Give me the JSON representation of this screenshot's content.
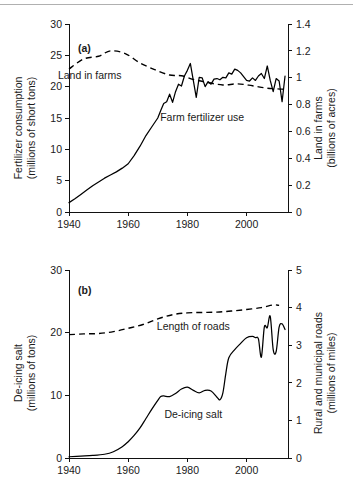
{
  "figure": {
    "background": "#ffffff",
    "line_color": "#000000",
    "axis_color": "#111111",
    "rule_color": "#b0b0b0"
  },
  "chart_data": [
    {
      "type": "line",
      "panel_tag": "(a)",
      "title": "",
      "xlabel": "",
      "ylabel": "Fertilizer consumption\n(millions of short tons)",
      "ylabel_line1": "Fertilizer consumption",
      "ylabel_line2": "(millions of short tons)",
      "y2label_line1": "Land in farms",
      "y2label_line2": "(billions of acres)",
      "xlim": [
        1940,
        2014
      ],
      "ylim": [
        0,
        30
      ],
      "y2lim": [
        0,
        1.4
      ],
      "grid": false,
      "legend_position": "inline-annotation",
      "xticks": [
        1940,
        1960,
        1980,
        2000
      ],
      "xtick_labels": [
        "1940",
        "1960",
        "1980",
        "2000"
      ],
      "yticks": [
        0,
        5,
        10,
        15,
        20,
        25,
        30
      ],
      "ytick_labels": [
        "0",
        "5",
        "10",
        "15",
        "20",
        "25",
        "30"
      ],
      "y2ticks": [
        0,
        0.2,
        0.4,
        0.6,
        0.8,
        1.0,
        1.2,
        1.4
      ],
      "y2tick_labels": [
        "0",
        "0.2",
        "0.4",
        "0.6",
        "0.8",
        "1",
        "1.2",
        "1.4"
      ],
      "series": [
        {
          "name": "Farm fertilizer use",
          "style": "solid",
          "axis": "left",
          "units": "millions of short tons",
          "x": [
            1940,
            1942,
            1944,
            1946,
            1948,
            1950,
            1952,
            1954,
            1956,
            1958,
            1960,
            1962,
            1964,
            1966,
            1968,
            1970,
            1971,
            1972,
            1973,
            1974,
            1975,
            1976,
            1977,
            1978,
            1979,
            1980,
            1981,
            1982,
            1983,
            1984,
            1985,
            1986,
            1987,
            1988,
            1989,
            1990,
            1991,
            1992,
            1993,
            1994,
            1995,
            1996,
            1997,
            1998,
            1999,
            2000,
            2001,
            2002,
            2003,
            2004,
            2005,
            2006,
            2007,
            2008,
            2009,
            2010,
            2011,
            2012,
            2013
          ],
          "y": [
            1.5,
            2.1,
            2.8,
            3.5,
            4.2,
            4.8,
            5.4,
            5.9,
            6.4,
            7.0,
            7.7,
            9.0,
            10.5,
            12.2,
            13.6,
            15.0,
            16.2,
            17.3,
            17.6,
            18.8,
            17.5,
            19.2,
            20.4,
            20.1,
            21.7,
            22.6,
            23.7,
            21.0,
            18.3,
            21.5,
            21.4,
            20.0,
            20.8,
            20.4,
            21.2,
            21.3,
            21.1,
            21.5,
            21.4,
            22.2,
            22.0,
            22.8,
            22.6,
            22.2,
            21.6,
            21.0,
            20.9,
            21.4,
            21.0,
            21.7,
            22.1,
            21.3,
            23.3,
            21.0,
            19.2,
            21.3,
            20.9,
            17.6,
            21.7
          ]
        },
        {
          "name": "Land in farms",
          "style": "dashed",
          "axis": "right",
          "units": "billions of acres",
          "x": [
            1940,
            1945,
            1950,
            1954,
            1959,
            1964,
            1969,
            1974,
            1978,
            1982,
            1987,
            1992,
            1997,
            2002,
            2007,
            2012,
            2013
          ],
          "y": [
            1.065,
            1.14,
            1.16,
            1.2,
            1.18,
            1.11,
            1.06,
            1.02,
            1.015,
            0.987,
            0.964,
            0.946,
            0.954,
            0.94,
            0.922,
            0.915,
            0.91
          ]
        }
      ],
      "annotations": [
        {
          "text": "Land in farms",
          "x_year": 1947,
          "y_value": 21.3
        },
        {
          "text": "Farm fertilizer use",
          "x_year": 1985,
          "y_value": 14.6
        }
      ]
    },
    {
      "type": "line",
      "panel_tag": "(b)",
      "title": "",
      "xlabel": "",
      "ylabel_line1": "De-icing salt",
      "ylabel_line2": "(millions of tons)",
      "y2label_line1": "Rural and municipal roads",
      "y2label_line2": "(millions of miles)",
      "xlim": [
        1940,
        2014
      ],
      "ylim": [
        0,
        30
      ],
      "y2lim": [
        0,
        5
      ],
      "grid": false,
      "legend_position": "inline-annotation",
      "xticks": [
        1940,
        1960,
        1980,
        2000
      ],
      "xtick_labels": [
        "1940",
        "1960",
        "1980",
        "2000"
      ],
      "yticks": [
        0,
        10,
        20,
        30
      ],
      "ytick_labels": [
        "0",
        "10",
        "20",
        "30"
      ],
      "y2ticks": [
        0,
        1,
        2,
        3,
        4,
        5
      ],
      "y2tick_labels": [
        "0",
        "1",
        "2",
        "3",
        "4",
        "5"
      ],
      "series": [
        {
          "name": "De-icing salt",
          "style": "solid",
          "axis": "left",
          "units": "millions of tons",
          "x": [
            1940,
            1944,
            1948,
            1952,
            1955,
            1958,
            1960,
            1962,
            1964,
            1966,
            1968,
            1970,
            1971,
            1972,
            1974,
            1976,
            1978,
            1980,
            1982,
            1984,
            1986,
            1988,
            1990,
            1991,
            1992,
            1993,
            1994,
            1996,
            1998,
            2000,
            2002,
            2003,
            2004,
            2005,
            2006,
            2007,
            2008,
            2009,
            2010,
            2011,
            2012,
            2013
          ],
          "y": [
            0.2,
            0.3,
            0.4,
            0.6,
            1.0,
            1.8,
            2.6,
            3.6,
            4.8,
            6.3,
            7.8,
            9.2,
            9.8,
            9.9,
            9.8,
            10.3,
            11.0,
            11.3,
            10.8,
            10.4,
            10.8,
            10.7,
            9.7,
            9.3,
            10.4,
            13.5,
            16.0,
            17.3,
            18.3,
            19.2,
            19.4,
            19.2,
            19.0,
            16.1,
            20.9,
            20.8,
            22.6,
            17.3,
            17.0,
            20.9,
            21.4,
            20.5
          ]
        },
        {
          "name": "Length of roads",
          "style": "dashed",
          "axis": "right",
          "units": "millions of miles",
          "x": [
            1940,
            1945,
            1950,
            1955,
            1960,
            1965,
            1970,
            1975,
            1980,
            1985,
            1990,
            1995,
            2000,
            2005,
            2009,
            2011
          ],
          "y": [
            3.28,
            3.3,
            3.31,
            3.36,
            3.45,
            3.55,
            3.7,
            3.81,
            3.86,
            3.87,
            3.88,
            3.91,
            3.95,
            4.0,
            4.07,
            4.06
          ]
        }
      ],
      "annotations": [
        {
          "text": "Length of roads",
          "x_year": 1982,
          "y_value": 20.4
        },
        {
          "text": "De-icing salt",
          "x_year": 1982,
          "y_value": 6.4
        }
      ]
    }
  ]
}
